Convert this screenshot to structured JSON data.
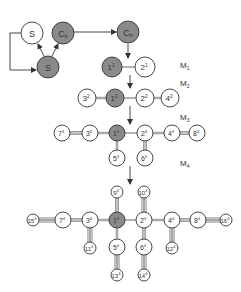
{
  "colors": {
    "filled": "#8a8a8a",
    "empty": "#ffffff",
    "stroke": "#333333",
    "bond": "#777777"
  },
  "stage_labels": [
    {
      "id": "M1",
      "base": "M",
      "sub": "1",
      "x": 180,
      "y": 68
    },
    {
      "id": "M2",
      "base": "M",
      "sub": "2",
      "x": 180,
      "y": 86
    },
    {
      "id": "M3",
      "base": "M",
      "sub": "3",
      "x": 180,
      "y": 120
    },
    {
      "id": "M4",
      "base": "M",
      "sub": "4",
      "x": 180,
      "y": 166
    }
  ],
  "cycle": {
    "nodes": [
      {
        "id": "S_top",
        "label": "S",
        "x": 32,
        "y": 33,
        "r": 11,
        "filled": false
      },
      {
        "id": "Cb",
        "label": "C",
        "sub": "b",
        "x": 63,
        "y": 33,
        "r": 11,
        "filled": true
      },
      {
        "id": "S_bottom",
        "label": "S",
        "x": 48,
        "y": 67,
        "r": 11,
        "filled": true
      },
      {
        "id": "Cb_right",
        "label": "C",
        "sub": "b",
        "x": 128,
        "y": 32,
        "r": 11,
        "filled": true
      }
    ]
  },
  "nodes": [
    {
      "id": "1-1",
      "num": "1",
      "gen": "1",
      "x": 112,
      "y": 67,
      "r": 10,
      "filled": true
    },
    {
      "id": "2-1",
      "num": "2",
      "gen": "1",
      "x": 145,
      "y": 67,
      "r": 10,
      "filled": false
    },
    {
      "id": "3-2",
      "num": "3",
      "gen": "2",
      "x": 87,
      "y": 98,
      "r": 9,
      "filled": false
    },
    {
      "id": "1-2",
      "num": "1",
      "gen": "2",
      "x": 115,
      "y": 98,
      "r": 9,
      "filled": true
    },
    {
      "id": "2-2",
      "num": "2",
      "gen": "2",
      "x": 145,
      "y": 98,
      "r": 9,
      "filled": false
    },
    {
      "id": "4-2",
      "num": "4",
      "gen": "2",
      "x": 170,
      "y": 98,
      "r": 9,
      "filled": false
    },
    {
      "id": "7-3",
      "num": "7",
      "gen": "3",
      "x": 62,
      "y": 133,
      "r": 8,
      "filled": false
    },
    {
      "id": "3-3",
      "num": "3",
      "gen": "3",
      "x": 90,
      "y": 133,
      "r": 8,
      "filled": false
    },
    {
      "id": "1-3",
      "num": "1",
      "gen": "3",
      "x": 117,
      "y": 133,
      "r": 8,
      "filled": true
    },
    {
      "id": "2-3",
      "num": "2",
      "gen": "3",
      "x": 145,
      "y": 133,
      "r": 8,
      "filled": false
    },
    {
      "id": "4-3",
      "num": "4",
      "gen": "3",
      "x": 172,
      "y": 133,
      "r": 8,
      "filled": false
    },
    {
      "id": "8-3",
      "num": "8",
      "gen": "3",
      "x": 197,
      "y": 133,
      "r": 8,
      "filled": false
    },
    {
      "id": "5-3",
      "num": "5",
      "gen": "3",
      "x": 117,
      "y": 158,
      "r": 8,
      "filled": false
    },
    {
      "id": "6-3",
      "num": "6",
      "gen": "3",
      "x": 145,
      "y": 158,
      "r": 8,
      "filled": false
    },
    {
      "id": "15-4",
      "num": "15",
      "gen": "4",
      "x": 33,
      "y": 220,
      "r": 6,
      "filled": false
    },
    {
      "id": "7-4",
      "num": "7",
      "gen": "4",
      "x": 63,
      "y": 220,
      "r": 8,
      "filled": false
    },
    {
      "id": "3-4",
      "num": "3",
      "gen": "4",
      "x": 90,
      "y": 220,
      "r": 8,
      "filled": false
    },
    {
      "id": "1-4",
      "num": "1",
      "gen": "4",
      "x": 117,
      "y": 220,
      "r": 8,
      "filled": true
    },
    {
      "id": "2-4",
      "num": "2",
      "gen": "4",
      "x": 144,
      "y": 220,
      "r": 8,
      "filled": false
    },
    {
      "id": "4-4",
      "num": "4",
      "gen": "4",
      "x": 172,
      "y": 220,
      "r": 8,
      "filled": false
    },
    {
      "id": "8-4",
      "num": "8",
      "gen": "4",
      "x": 198,
      "y": 220,
      "r": 8,
      "filled": false
    },
    {
      "id": "16-4",
      "num": "16",
      "gen": "4",
      "x": 226,
      "y": 220,
      "r": 6,
      "filled": false
    },
    {
      "id": "9-4",
      "num": "9",
      "gen": "4",
      "x": 117,
      "y": 192,
      "r": 6,
      "filled": false
    },
    {
      "id": "10-4",
      "num": "10",
      "gen": "4",
      "x": 144,
      "y": 192,
      "r": 6,
      "filled": false
    },
    {
      "id": "11-4",
      "num": "11",
      "gen": "4",
      "x": 90,
      "y": 248,
      "r": 6,
      "filled": false
    },
    {
      "id": "5-4",
      "num": "5",
      "gen": "4",
      "x": 117,
      "y": 247,
      "r": 8,
      "filled": false
    },
    {
      "id": "6-4",
      "num": "6",
      "gen": "4",
      "x": 144,
      "y": 247,
      "r": 8,
      "filled": false
    },
    {
      "id": "12-4",
      "num": "12",
      "gen": "4",
      "x": 172,
      "y": 248,
      "r": 6,
      "filled": false
    },
    {
      "id": "13-4",
      "num": "13",
      "gen": "4",
      "x": 117,
      "y": 275,
      "r": 6,
      "filled": false
    },
    {
      "id": "14-4",
      "num": "14",
      "gen": "4",
      "x": 144,
      "y": 275,
      "r": 6,
      "filled": false
    }
  ],
  "edges": [
    {
      "from": "1-1",
      "to": "2-1",
      "lines": 1
    },
    {
      "from": "3-2",
      "to": "1-2",
      "lines": 2
    },
    {
      "from": "1-2",
      "to": "2-2",
      "lines": 1
    },
    {
      "from": "2-2",
      "to": "4-2",
      "lines": 2
    },
    {
      "from": "7-3",
      "to": "3-3",
      "lines": 3
    },
    {
      "from": "3-3",
      "to": "1-3",
      "lines": 2
    },
    {
      "from": "1-3",
      "to": "2-3",
      "lines": 1
    },
    {
      "from": "2-3",
      "to": "4-3",
      "lines": 2
    },
    {
      "from": "4-3",
      "to": "8-3",
      "lines": 3
    },
    {
      "from": "1-3",
      "to": "5-3",
      "lines": 2
    },
    {
      "from": "2-3",
      "to": "6-3",
      "lines": 3
    },
    {
      "from": "15-4",
      "to": "7-4",
      "lines": 4
    },
    {
      "from": "7-4",
      "to": "3-4",
      "lines": 3
    },
    {
      "from": "3-4",
      "to": "1-4",
      "lines": 2
    },
    {
      "from": "1-4",
      "to": "2-4",
      "lines": 1
    },
    {
      "from": "2-4",
      "to": "4-4",
      "lines": 2
    },
    {
      "from": "4-4",
      "to": "8-4",
      "lines": 3
    },
    {
      "from": "8-4",
      "to": "16-4",
      "lines": 4
    },
    {
      "from": "9-4",
      "to": "1-4",
      "lines": 3
    },
    {
      "from": "10-4",
      "to": "2-4",
      "lines": 4
    },
    {
      "from": "3-4",
      "to": "11-4",
      "lines": 4
    },
    {
      "from": "1-4",
      "to": "5-4",
      "lines": 2
    },
    {
      "from": "2-4",
      "to": "6-4",
      "lines": 3
    },
    {
      "from": "4-4",
      "to": "12-4",
      "lines": 4
    },
    {
      "from": "5-4",
      "to": "13-4",
      "lines": 4
    },
    {
      "from": "6-4",
      "to": "14-4",
      "lines": 4
    }
  ],
  "arrows": [
    {
      "id": "cb-to-cb",
      "points": [
        [
          74,
          32
        ],
        [
          116,
          32
        ]
      ]
    },
    {
      "id": "cb-to-m1",
      "points": [
        [
          128,
          44
        ],
        [
          128,
          58
        ]
      ]
    },
    {
      "id": "m1-to-m2",
      "points": [
        [
          130,
          75
        ],
        [
          130,
          88
        ]
      ]
    },
    {
      "id": "m2-to-m3",
      "points": [
        [
          130,
          106
        ],
        [
          130,
          124
        ]
      ]
    },
    {
      "id": "m3-to-m4",
      "points": [
        [
          130,
          166
        ],
        [
          130,
          184
        ]
      ]
    },
    {
      "id": "loop-to-s",
      "points": [
        [
          21,
          33
        ],
        [
          10,
          33
        ],
        [
          10,
          70
        ],
        [
          36,
          70
        ]
      ]
    },
    {
      "id": "s-to-s-top",
      "points": [
        [
          44,
          56
        ],
        [
          38,
          44
        ]
      ]
    },
    {
      "id": "s-to-cb",
      "points": [
        [
          52,
          56
        ],
        [
          58,
          44
        ]
      ]
    }
  ]
}
